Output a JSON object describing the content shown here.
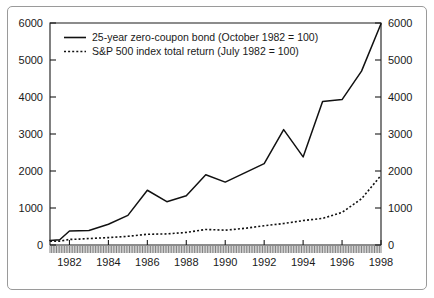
{
  "chart_data": {
    "type": "line",
    "title": "",
    "xlabel": "",
    "ylabel": "",
    "xlim": [
      1981.0,
      1998.0
    ],
    "ylim": [
      0,
      6000
    ],
    "grid": false,
    "legend_position": "top-left-inside",
    "dual_axis": true,
    "left_axis_ticks": [
      "0",
      "1000",
      "2000",
      "3000",
      "4000",
      "5000",
      "6000"
    ],
    "right_axis_ticks": [
      "0",
      "1000",
      "2000",
      "3000",
      "4000",
      "5000",
      "6000"
    ],
    "x_tick_labels": [
      "1982",
      "1984",
      "1986",
      "1988",
      "1990",
      "1992",
      "1994",
      "1996",
      "1998"
    ],
    "x_tick_values": [
      1982,
      1984,
      1986,
      1988,
      1990,
      1992,
      1994,
      1996,
      1998
    ],
    "y_tick_values": [
      0,
      1000,
      2000,
      3000,
      4000,
      5000,
      6000
    ],
    "minor_ticks": "monthly",
    "x": [
      1981.0,
      1981.5,
      1982.0,
      1982.5,
      1983.0,
      1984.0,
      1985.0,
      1986.0,
      1987.0,
      1988.0,
      1989.0,
      1990.0,
      1991.0,
      1992.0,
      1993.0,
      1994.0,
      1995.0,
      1996.0,
      1997.0,
      1998.0
    ],
    "series": [
      {
        "name": "25-year zero-coupon bond (October 1982 = 100)",
        "style": "solid",
        "color": "#111111",
        "values": [
          120,
          140,
          380,
          385,
          390,
          560,
          800,
          1480,
          1170,
          1330,
          1900,
          1700,
          1950,
          2200,
          3120,
          2380,
          3880,
          3930,
          4700,
          5980
        ]
      },
      {
        "name": "S&P 500 index total return (July 1982 = 100)",
        "style": "dotted",
        "color": "#111111",
        "values": [
          100,
          105,
          150,
          160,
          175,
          200,
          235,
          290,
          300,
          340,
          420,
          400,
          450,
          520,
          580,
          660,
          720,
          880,
          1250,
          1880
        ]
      }
    ],
    "legend": [
      {
        "label": "25-year zero-coupon bond (October 1982 = 100)",
        "style": "solid"
      },
      {
        "label": "S&P 500 index total return (July 1982 = 100)",
        "style": "dotted"
      }
    ],
    "colors": {
      "background": "#ffffff",
      "frame": "#9a9a9a",
      "axis": "#1a1a1a",
      "line": "#111111"
    }
  }
}
